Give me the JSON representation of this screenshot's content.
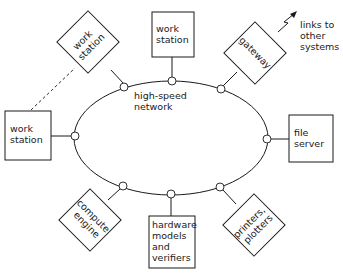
{
  "diagram": {
    "network_label": [
      "high-speed",
      "network"
    ],
    "external_label": [
      "links to",
      "other",
      "systems"
    ],
    "devices": {
      "top_workstation": [
        "work",
        "station"
      ],
      "upper_left_workstation": [
        "work",
        "station"
      ],
      "left_workstation": [
        "work",
        "station"
      ],
      "gateway": [
        "gateway"
      ],
      "file_server": [
        "file",
        "server"
      ],
      "compute_engine": [
        "compute",
        "engine"
      ],
      "hardware_models": [
        "hardware",
        "models",
        "and",
        "verifiers"
      ],
      "printers": [
        "printers,",
        "plotters"
      ]
    },
    "colors": {
      "line": "#1a1a1a",
      "background": "#ffffff"
    }
  }
}
